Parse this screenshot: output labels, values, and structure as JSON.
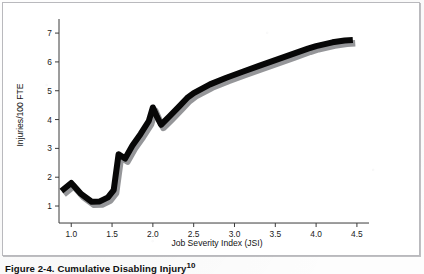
{
  "figure": {
    "caption_text": "Figure 2-4. Cumulative Disabling Injury",
    "caption_superscript": "10"
  },
  "chart_data": {
    "type": "line",
    "title": "",
    "xlabel": "Job Severity Index (JSI)",
    "ylabel": "Injuries/100 FTE",
    "xlim": [
      0.85,
      4.55
    ],
    "ylim": [
      0.55,
      7.35
    ],
    "xticks": [
      "1.0",
      "1.5",
      "2.0",
      "2.5",
      "3.0",
      "3.5",
      "4.0",
      "4.5"
    ],
    "xtick_values": [
      1.0,
      1.5,
      2.0,
      2.5,
      3.0,
      3.5,
      4.0,
      4.5
    ],
    "yticks": [
      "1",
      "2",
      "3",
      "4",
      "5",
      "6",
      "7"
    ],
    "ytick_values": [
      1,
      2,
      3,
      4,
      5,
      6,
      7
    ],
    "grid": false,
    "legend": null,
    "series": [
      {
        "name": "Cumulative disabling injury rate",
        "color": "#070707",
        "shadow_color": "#8f9094",
        "line_width": 6,
        "x": [
          0.88,
          1.0,
          1.12,
          1.25,
          1.35,
          1.45,
          1.52,
          1.58,
          1.66,
          1.75,
          1.85,
          1.95,
          2.0,
          2.05,
          2.1,
          2.2,
          2.32,
          2.42,
          2.5,
          2.7,
          2.9,
          3.1,
          3.3,
          3.5,
          3.7,
          3.9,
          4.0,
          4.2,
          4.35,
          4.45
        ],
        "y": [
          1.52,
          1.8,
          1.42,
          1.15,
          1.16,
          1.3,
          1.55,
          2.8,
          2.65,
          3.1,
          3.5,
          3.95,
          4.42,
          4.1,
          3.82,
          4.1,
          4.45,
          4.75,
          4.92,
          5.22,
          5.45,
          5.66,
          5.86,
          6.06,
          6.26,
          6.46,
          6.55,
          6.68,
          6.74,
          6.76
        ]
      }
    ]
  }
}
